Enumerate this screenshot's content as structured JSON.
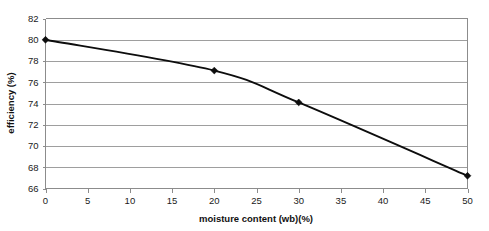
{
  "chart_data": {
    "type": "line",
    "title": "",
    "xlabel": "moisture content (wb)(%)",
    "ylabel": "efficiency (%)",
    "x": [
      0,
      20,
      30,
      50
    ],
    "values": [
      80.0,
      77.1,
      74.1,
      67.2
    ],
    "series": [
      {
        "name": "efficiency",
        "x": [
          0,
          20,
          30,
          50
        ],
        "values": [
          80.0,
          77.1,
          74.1,
          67.2
        ]
      }
    ],
    "xlim": [
      0,
      50
    ],
    "ylim": [
      66,
      82
    ],
    "xticks": [
      0,
      5,
      10,
      15,
      20,
      25,
      30,
      35,
      40,
      45,
      50
    ],
    "yticks": [
      66,
      68,
      70,
      72,
      74,
      76,
      78,
      80,
      82
    ],
    "xtick_labels": [
      "0",
      "5",
      "10",
      "15",
      "20",
      "25",
      "30",
      "35",
      "40",
      "45",
      "50"
    ],
    "ytick_labels": [
      "66",
      "68",
      "70",
      "72",
      "74",
      "76",
      "78",
      "80",
      "82"
    ],
    "grid": "horizontal",
    "legend": "none",
    "marker": "diamond",
    "line_smoothing": true,
    "colors": {
      "line": "#0d0d0d",
      "marker": "#0d0d0d",
      "grid": "#9e9e9e",
      "axis": "#8c8c8c",
      "background": "#ffffff",
      "text": "#1a1a1a"
    }
  }
}
